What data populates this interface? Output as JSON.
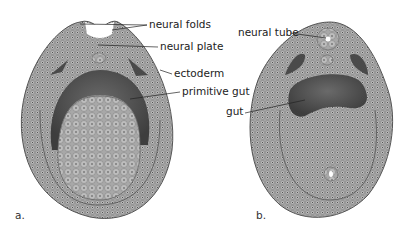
{
  "figure": {
    "panels": [
      {
        "id": "a",
        "panel_label": "a.",
        "labels": {
          "neural_folds": "neural folds",
          "neural_plate": "neural plate",
          "ectoderm": "ectoderm",
          "primitive_gut": "primitive gut"
        }
      },
      {
        "id": "b",
        "panel_label": "b.",
        "labels": {
          "neural_tube": "neural tube",
          "gut": "gut"
        }
      }
    ],
    "colors": {
      "tissue": "#9a9a9a",
      "cavity": "#5a5a5a",
      "lumen": "#ffffff",
      "background": "#ffffff"
    }
  }
}
